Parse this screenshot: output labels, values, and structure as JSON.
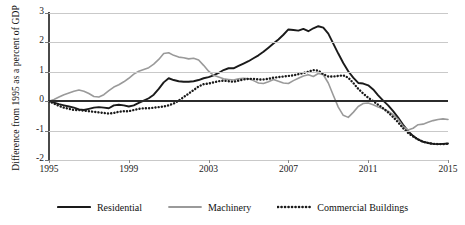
{
  "chart_data": {
    "type": "line",
    "title": "",
    "xlabel": "",
    "ylabel": "Difference from 1995 as a percent of GDP",
    "xlim": [
      1995,
      2015
    ],
    "ylim": [
      -2,
      3
    ],
    "grid": true,
    "legend_position": "bottom",
    "x_ticks": [
      "1995",
      "1999",
      "2003",
      "2007",
      "2011",
      "2015"
    ],
    "x_tick_values": [
      1995,
      1999,
      2003,
      2007,
      2011,
      2015
    ],
    "y_ticks": [
      "3",
      "2",
      "1",
      "0",
      "-1",
      "-2"
    ],
    "y_tick_values": [
      3,
      2,
      1,
      0,
      -1,
      -2
    ],
    "x": [
      1995.0,
      1995.25,
      1995.5,
      1995.75,
      1996.0,
      1996.25,
      1996.5,
      1996.75,
      1997.0,
      1997.25,
      1997.5,
      1997.75,
      1998.0,
      1998.25,
      1998.5,
      1998.75,
      1999.0,
      1999.25,
      1999.5,
      1999.75,
      2000.0,
      2000.25,
      2000.5,
      2000.75,
      2001.0,
      2001.25,
      2001.5,
      2001.75,
      2002.0,
      2002.25,
      2002.5,
      2002.75,
      2003.0,
      2003.25,
      2003.5,
      2003.75,
      2004.0,
      2004.25,
      2004.5,
      2004.75,
      2005.0,
      2005.25,
      2005.5,
      2005.75,
      2006.0,
      2006.25,
      2006.5,
      2006.75,
      2007.0,
      2007.25,
      2007.5,
      2007.75,
      2008.0,
      2008.25,
      2008.5,
      2008.75,
      2009.0,
      2009.25,
      2009.5,
      2009.75,
      2010.0,
      2010.25,
      2010.5,
      2010.75,
      2011.0,
      2011.25,
      2011.5,
      2011.75,
      2012.0,
      2012.25,
      2012.5,
      2012.75,
      2013.0,
      2013.25,
      2013.5,
      2013.75,
      2014.0,
      2014.25,
      2014.5,
      2014.75,
      2015.0
    ],
    "series": [
      {
        "name": "Residential",
        "color": "#1a1a1a",
        "style": "solid",
        "values": [
          0.0,
          -0.05,
          -0.1,
          -0.14,
          -0.18,
          -0.22,
          -0.28,
          -0.3,
          -0.26,
          -0.22,
          -0.2,
          -0.22,
          -0.24,
          -0.14,
          -0.12,
          -0.14,
          -0.18,
          -0.14,
          -0.06,
          0.02,
          0.1,
          0.22,
          0.42,
          0.64,
          0.78,
          0.72,
          0.68,
          0.66,
          0.66,
          0.68,
          0.72,
          0.78,
          0.82,
          0.88,
          0.96,
          1.06,
          1.12,
          1.12,
          1.2,
          1.28,
          1.36,
          1.46,
          1.56,
          1.68,
          1.82,
          1.96,
          2.1,
          2.26,
          2.44,
          2.42,
          2.4,
          2.46,
          2.38,
          2.48,
          2.55,
          2.5,
          2.3,
          1.96,
          1.62,
          1.3,
          1.02,
          0.8,
          0.62,
          0.6,
          0.54,
          0.4,
          0.2,
          0.02,
          -0.14,
          -0.34,
          -0.56,
          -0.8,
          -1.02,
          -1.18,
          -1.3,
          -1.38,
          -1.42,
          -1.45,
          -1.46,
          -1.45,
          -1.44
        ]
      },
      {
        "name": "Machinery",
        "color": "#9a9a9a",
        "style": "solid",
        "values": [
          0.0,
          0.06,
          0.14,
          0.22,
          0.28,
          0.34,
          0.38,
          0.34,
          0.26,
          0.16,
          0.14,
          0.22,
          0.36,
          0.48,
          0.56,
          0.66,
          0.78,
          0.92,
          1.02,
          1.08,
          1.14,
          1.26,
          1.42,
          1.62,
          1.65,
          1.56,
          1.5,
          1.48,
          1.44,
          1.46,
          1.4,
          1.22,
          1.02,
          0.88,
          0.82,
          0.76,
          0.74,
          0.72,
          0.76,
          0.78,
          0.76,
          0.7,
          0.62,
          0.6,
          0.66,
          0.74,
          0.68,
          0.62,
          0.6,
          0.7,
          0.78,
          0.86,
          0.9,
          0.84,
          0.94,
          0.9,
          0.62,
          0.2,
          -0.2,
          -0.48,
          -0.55,
          -0.38,
          -0.18,
          -0.08,
          -0.06,
          -0.12,
          -0.2,
          -0.26,
          -0.34,
          -0.46,
          -0.62,
          -0.86,
          -0.98,
          -0.92,
          -0.8,
          -0.78,
          -0.72,
          -0.66,
          -0.62,
          -0.6,
          -0.62
        ]
      },
      {
        "name": "Commercial Buildings",
        "color": "#1a1a1a",
        "style": "dotted",
        "values": [
          0.0,
          -0.08,
          -0.16,
          -0.22,
          -0.26,
          -0.3,
          -0.3,
          -0.32,
          -0.34,
          -0.36,
          -0.38,
          -0.4,
          -0.42,
          -0.4,
          -0.36,
          -0.34,
          -0.34,
          -0.3,
          -0.26,
          -0.24,
          -0.24,
          -0.22,
          -0.2,
          -0.18,
          -0.14,
          -0.08,
          0.02,
          0.14,
          0.26,
          0.38,
          0.5,
          0.58,
          0.6,
          0.64,
          0.68,
          0.7,
          0.68,
          0.66,
          0.7,
          0.74,
          0.76,
          0.76,
          0.74,
          0.74,
          0.76,
          0.8,
          0.82,
          0.84,
          0.86,
          0.88,
          0.92,
          0.96,
          1.0,
          1.06,
          1.04,
          0.92,
          0.84,
          0.84,
          0.86,
          0.88,
          0.8,
          0.62,
          0.42,
          0.26,
          0.12,
          0.0,
          -0.12,
          -0.24,
          -0.38,
          -0.54,
          -0.72,
          -0.92,
          -1.08,
          -1.2,
          -1.3,
          -1.38,
          -1.42,
          -1.45,
          -1.46,
          -1.46,
          -1.45
        ]
      }
    ]
  },
  "legend": {
    "items": [
      {
        "label": "Residential",
        "color": "#1a1a1a",
        "style": "solid"
      },
      {
        "label": "Machinery",
        "color": "#9a9a9a",
        "style": "solid"
      },
      {
        "label": "Commercial Buildings",
        "color": "#1a1a1a",
        "style": "dotted"
      }
    ]
  }
}
